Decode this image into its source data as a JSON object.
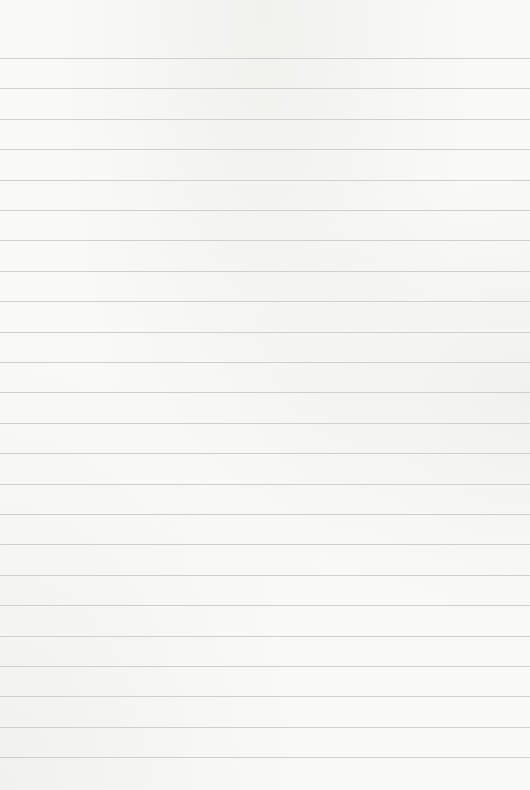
{
  "paper": {
    "type": "lined",
    "background_color": "#f9f9f7",
    "line_color": "#cfcfcf",
    "first_line_y": 58,
    "line_spacing": 30.4,
    "line_count": 24
  }
}
